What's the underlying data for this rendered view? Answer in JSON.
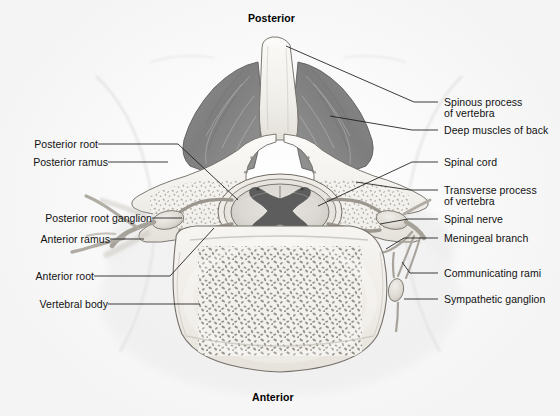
{
  "figure": {
    "background_color": "#fafafa",
    "ink_color": "#1a1a1a",
    "muscle_color": "#8b8b8b",
    "bone_color": "#f2f0ec",
    "cord_color": "#d8d6d2"
  },
  "orientation": {
    "top": "Posterior",
    "bottom": "Anterior"
  },
  "labels_left": [
    {
      "text": "Posterior root",
      "x": 22,
      "y": 145
    },
    {
      "text": "Posterior ramus",
      "x": 18,
      "y": 163
    },
    {
      "text": "Posterior root ganglion",
      "x": 14,
      "y": 219
    },
    {
      "text": "Anterior ramus",
      "x": 20,
      "y": 240
    },
    {
      "text": "Anterior root",
      "x": 22,
      "y": 277
    },
    {
      "text": "Vertebral body",
      "x": 20,
      "y": 305
    }
  ],
  "labels_right": [
    {
      "line1": "Spinous process",
      "line2": "of vertebra",
      "x": 444,
      "y": 98
    },
    {
      "line1": "Deep muscles of back",
      "line2": "",
      "x": 444,
      "y": 126
    },
    {
      "line1": "Spinal cord",
      "line2": "",
      "x": 444,
      "y": 158
    },
    {
      "line1": "Transverse process",
      "line2": "of vertebra",
      "x": 444,
      "y": 186
    },
    {
      "line1": "Spinal nerve",
      "line2": "",
      "x": 444,
      "y": 215
    },
    {
      "line1": "Meningeal branch",
      "line2": "",
      "x": 444,
      "y": 234
    },
    {
      "line1": "Communicating rami",
      "line2": "",
      "x": 444,
      "y": 269
    },
    {
      "line1": "Sympathetic ganglion",
      "line2": "",
      "x": 444,
      "y": 295
    }
  ],
  "structures": [
    "spinous process of vertebra",
    "deep muscles of back",
    "vertebral arch / lamina",
    "transverse process of vertebra",
    "vertebral canal",
    "spinal cord with gray matter",
    "posterior root",
    "posterior root ganglion",
    "anterior root",
    "spinal nerve",
    "posterior ramus",
    "anterior ramus",
    "meningeal branch",
    "communicating rami",
    "sympathetic ganglion",
    "vertebral body with trabecular bone"
  ]
}
